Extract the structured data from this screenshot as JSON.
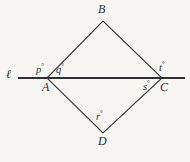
{
  "figure": {
    "kind": "geometry-diagram",
    "background_color": "#f7f6f3",
    "stroke_color": "#3a3a45",
    "line_color": "#2f2f38",
    "text_color": "#2b2b33",
    "transversal_line": {
      "name": "line-l",
      "label": "ℓ",
      "from_x": 18,
      "to_x": 185,
      "y": 78,
      "thickness": 2
    },
    "vertices": [
      {
        "id": "A",
        "label": "A",
        "x": 47,
        "y": 78,
        "label_x": 42,
        "label_y": 81
      },
      {
        "id": "B",
        "label": "B",
        "x": 103,
        "y": 21,
        "label_x": 98,
        "label_y": 3
      },
      {
        "id": "C",
        "label": "C",
        "x": 162,
        "y": 78,
        "label_x": 160,
        "label_y": 81
      },
      {
        "id": "D",
        "label": "D",
        "x": 103,
        "y": 133,
        "label_x": 98,
        "label_y": 135
      }
    ],
    "edges": [
      {
        "name": "edge-A-B",
        "from": "A",
        "to": "B"
      },
      {
        "name": "edge-B-C",
        "from": "B",
        "to": "C"
      },
      {
        "name": "edge-C-D",
        "from": "C",
        "to": "D"
      },
      {
        "name": "edge-D-A",
        "from": "D",
        "to": "A"
      }
    ],
    "angle_labels": [
      {
        "id": "p",
        "text": "p",
        "degree": "°",
        "x": 36,
        "y": 63,
        "at_vertex": "A",
        "position": "upper-left"
      },
      {
        "id": "q",
        "text": "q",
        "degree": "°",
        "x": 56,
        "y": 63,
        "at_vertex": "A",
        "position": "upper-right"
      },
      {
        "id": "t",
        "text": "t",
        "degree": "°",
        "x": 159,
        "y": 61,
        "at_vertex": "C",
        "position": "upper-right"
      },
      {
        "id": "s",
        "text": "s",
        "degree": "°",
        "x": 143,
        "y": 80,
        "at_vertex": "C",
        "position": "lower-left"
      },
      {
        "id": "r",
        "text": "r",
        "degree": "°",
        "x": 96,
        "y": 110,
        "at_vertex": "D",
        "position": "above"
      }
    ],
    "line_label": {
      "text": "ℓ",
      "x": 6,
      "y": 68
    }
  }
}
